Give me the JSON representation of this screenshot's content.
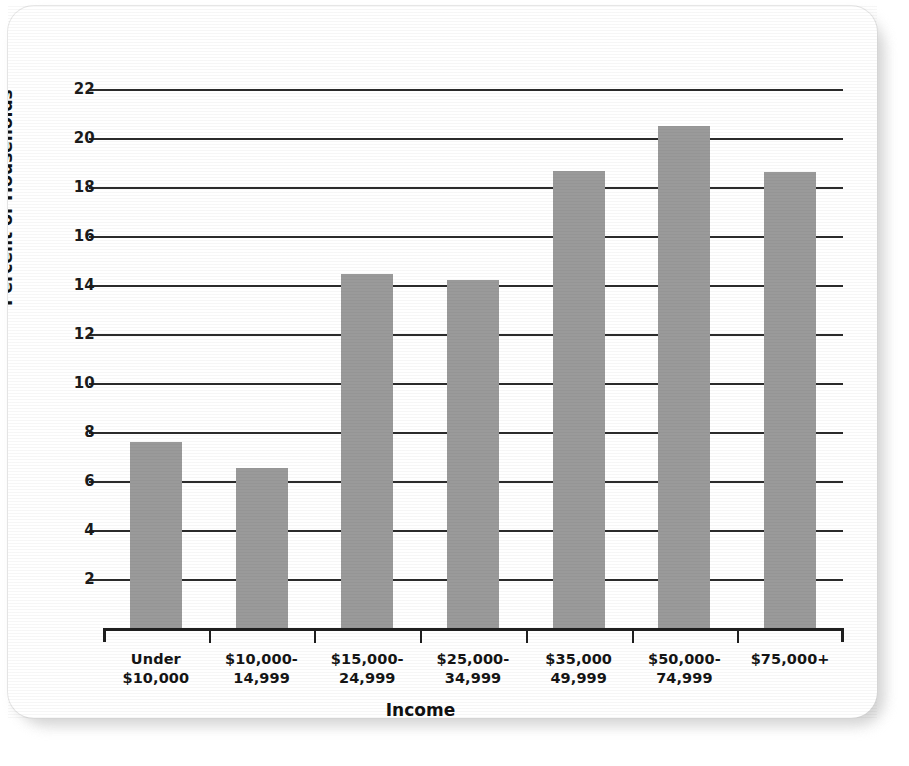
{
  "chart_data": {
    "type": "bar",
    "title": "",
    "xlabel": "Income",
    "ylabel": "Percent of Households",
    "categories": [
      "Under\n$10,000",
      "$10,000-\n14,999",
      "$15,000-\n24,999",
      "$25,000-\n34,999",
      "$35,000\n49,999",
      "$50,000-\n74,999",
      "$75,000+"
    ],
    "values": [
      7.6,
      6.55,
      14.45,
      14.2,
      18.65,
      20.5,
      18.6
    ],
    "ylim": [
      0,
      23
    ],
    "yticks": [
      2,
      4,
      6,
      8,
      10,
      12,
      14,
      16,
      18,
      20,
      22
    ],
    "ytick_labels": [
      "2",
      "4",
      "6",
      "8",
      "10",
      "12",
      "14",
      "16",
      "18",
      "20",
      "22"
    ],
    "grid": true,
    "grid_axis": "y",
    "legend": false,
    "bar_color": "#9a9a9a",
    "axis_color": "#1f1f1f",
    "text_color": "#111111"
  }
}
